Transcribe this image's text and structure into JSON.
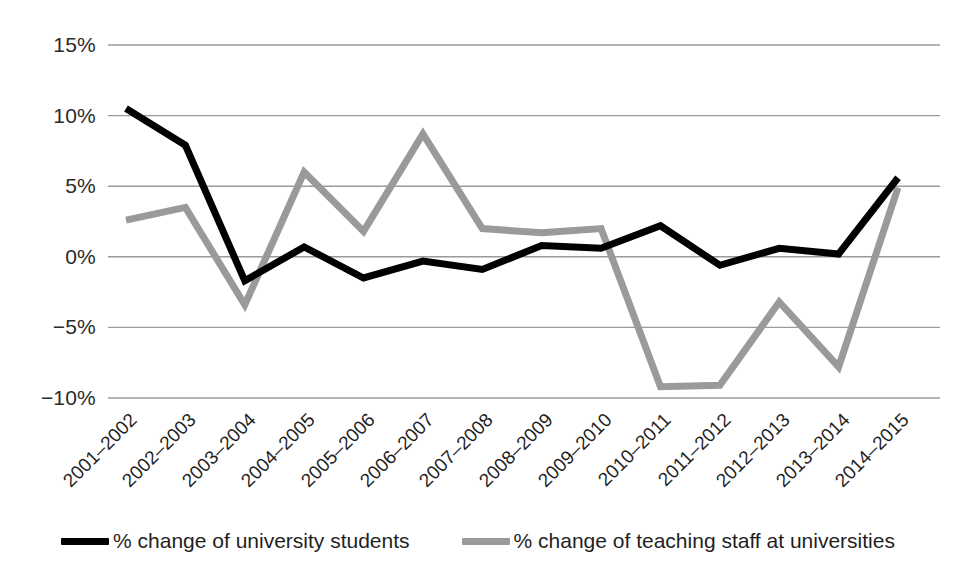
{
  "chart_data": {
    "type": "line",
    "title": "",
    "subtitle": "",
    "xlabel": "",
    "ylabel": "",
    "categories": [
      "2001–2002",
      "2002–2003",
      "2003–2004",
      "2004–2005",
      "2005–2006",
      "2006–2007",
      "2007–2008",
      "2008–2009",
      "2009–2010",
      "2010–2011",
      "2011–2012",
      "2012–2013",
      "2013–2014",
      "2014–2015"
    ],
    "series": [
      {
        "name": "% change of university students",
        "color": "#000000",
        "values": [
          10.5,
          7.9,
          -1.7,
          0.7,
          -1.5,
          -0.3,
          -0.9,
          0.8,
          0.6,
          2.2,
          -0.6,
          0.6,
          0.2,
          5.6
        ]
      },
      {
        "name": "% change of teaching staff at universities",
        "color": "#9a9a9a",
        "values": [
          2.6,
          3.5,
          -3.4,
          6.0,
          1.8,
          8.7,
          2.0,
          1.7,
          2.0,
          -9.2,
          -9.1,
          -3.2,
          -7.8,
          4.9
        ]
      }
    ],
    "ylim": [
      -10,
      15
    ],
    "yticks": [
      15,
      10,
      5,
      0,
      -5,
      -10
    ],
    "ytick_labels": [
      "15%",
      "10%",
      "5%",
      "0%",
      "−5%",
      "−10%"
    ],
    "grid": true,
    "grid_color": "#9a9a9a",
    "legend_position": "bottom",
    "background": "#ffffff"
  }
}
